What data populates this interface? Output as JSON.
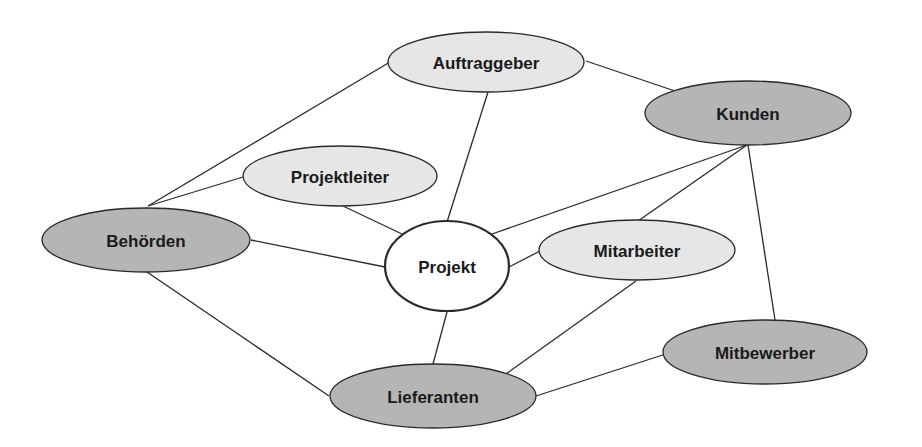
{
  "diagram": {
    "type": "stakeholder-network",
    "colors": {
      "line": "#2a2a2a",
      "light_fill": "#e6e6e6",
      "dark_fill": "#b5b5b5",
      "center_fill": "#ffffff",
      "text": "#1a1a1a"
    },
    "nodes": [
      {
        "id": "auftraggeber",
        "label": "Auftraggeber",
        "cx": 486,
        "cy": 62,
        "rx": 98,
        "ry": 30,
        "fill": "#e6e6e6",
        "style": "light"
      },
      {
        "id": "kunden",
        "label": "Kunden",
        "cx": 748,
        "cy": 113,
        "rx": 103,
        "ry": 32,
        "fill": "#b5b5b5",
        "style": "dark"
      },
      {
        "id": "projektleiter",
        "label": "Projektleiter",
        "cx": 340,
        "cy": 176,
        "rx": 97,
        "ry": 30,
        "fill": "#e6e6e6",
        "style": "light"
      },
      {
        "id": "behoerden",
        "label": "Behörden",
        "cx": 146,
        "cy": 240,
        "rx": 104,
        "ry": 32,
        "fill": "#b5b5b5",
        "style": "dark"
      },
      {
        "id": "projekt",
        "label": "Projekt",
        "cx": 447,
        "cy": 266,
        "rx": 62,
        "ry": 45,
        "fill": "#ffffff",
        "style": "center"
      },
      {
        "id": "mitarbeiter",
        "label": "Mitarbeiter",
        "cx": 637,
        "cy": 250,
        "rx": 98,
        "ry": 30,
        "fill": "#e6e6e6",
        "style": "light"
      },
      {
        "id": "mitbewerber",
        "label": "Mitbewerber",
        "cx": 765,
        "cy": 352,
        "rx": 102,
        "ry": 32,
        "fill": "#b5b5b5",
        "style": "dark"
      },
      {
        "id": "lieferanten",
        "label": "Lieferanten",
        "cx": 433,
        "cy": 396,
        "rx": 103,
        "ry": 32,
        "fill": "#b5b5b5",
        "style": "dark"
      }
    ],
    "edges": [
      {
        "from": "behoerden",
        "to": "auftraggeber",
        "x1": 148,
        "y1": 206,
        "x2": 390,
        "y2": 62
      },
      {
        "from": "behoerden",
        "to": "projektleiter",
        "x1": 148,
        "y1": 206,
        "x2": 243,
        "y2": 177
      },
      {
        "from": "projektleiter",
        "to": "projekt",
        "x1": 343,
        "y1": 206,
        "x2": 402,
        "y2": 234
      },
      {
        "from": "auftraggeber",
        "to": "projekt",
        "x1": 488,
        "y1": 92,
        "x2": 447,
        "y2": 222
      },
      {
        "from": "auftraggeber",
        "to": "kunden",
        "x1": 586,
        "y1": 61,
        "x2": 675,
        "y2": 91
      },
      {
        "from": "kunden",
        "to": "projekt",
        "x1": 747,
        "y1": 145,
        "x2": 492,
        "y2": 234
      },
      {
        "from": "kunden",
        "to": "mitarbeiter",
        "x1": 747,
        "y1": 145,
        "x2": 638,
        "y2": 221
      },
      {
        "from": "kunden",
        "to": "mitbewerber",
        "x1": 748,
        "y1": 145,
        "x2": 775,
        "y2": 320
      },
      {
        "from": "behoerden",
        "to": "projekt",
        "x1": 251,
        "y1": 240,
        "x2": 385,
        "y2": 267
      },
      {
        "from": "projekt",
        "to": "mitarbeiter",
        "x1": 509,
        "y1": 267,
        "x2": 540,
        "y2": 251
      },
      {
        "from": "behoerden",
        "to": "lieferanten",
        "x1": 147,
        "y1": 272,
        "x2": 329,
        "y2": 396
      },
      {
        "from": "projekt",
        "to": "lieferanten",
        "x1": 447,
        "y1": 312,
        "x2": 433,
        "y2": 364
      },
      {
        "from": "mitarbeiter",
        "to": "lieferanten",
        "x1": 636,
        "y1": 281,
        "x2": 506,
        "y2": 374
      },
      {
        "from": "lieferanten",
        "to": "mitbewerber",
        "x1": 536,
        "y1": 396,
        "x2": 672,
        "y2": 352
      }
    ]
  }
}
